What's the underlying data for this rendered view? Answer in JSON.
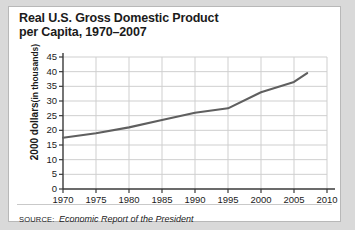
{
  "figure": {
    "title_lines": [
      "Real U.S. Gross Domestic Product",
      "per Capita, 1970–2007"
    ],
    "source_label": "SOURCE:",
    "source_text": "Economic Report of the President",
    "colors": {
      "page_background": "#d9d9d9",
      "card_background": "#ffffff",
      "card_border": "#b8b8b8",
      "text": "#1b1b1b",
      "axis": "#3a3a3a",
      "gridline": "#cfcfcf",
      "series_line": "#5f5f5f",
      "rule": "#c9c9c9"
    }
  },
  "chart_data": {
    "type": "line",
    "title": "Real U.S. Gross Domestic Product per Capita, 1970–2007",
    "xlabel": "",
    "ylabel": "2000 dollars (in thousands)",
    "ylabel_strong": "2000 dollars",
    "ylabel_light": "(in thousands)",
    "xlim": [
      1970,
      2010
    ],
    "ylim": [
      0,
      45
    ],
    "xticks": [
      1970,
      1975,
      1980,
      1985,
      1990,
      1995,
      2000,
      2005,
      2010
    ],
    "xtick_labels": [
      "1970",
      "1975",
      "1980",
      "1985",
      "1990",
      "1995",
      "2000",
      "2005",
      "2010"
    ],
    "yticks": [
      0,
      5,
      10,
      15,
      20,
      25,
      30,
      35,
      40,
      45
    ],
    "ytick_labels": [
      "0",
      "5",
      "10",
      "15",
      "20",
      "25",
      "30",
      "35",
      "40",
      "45"
    ],
    "grid": {
      "horizontal": true,
      "vertical": true
    },
    "legend": {
      "visible": false,
      "position": "none"
    },
    "series": [
      {
        "name": "Real GDP per capita",
        "x": [
          1970,
          1975,
          1980,
          1985,
          1990,
          1995,
          2000,
          2005,
          2007
        ],
        "values": [
          17.5,
          19.0,
          21.0,
          23.5,
          26.0,
          27.5,
          33.0,
          36.5,
          39.5
        ]
      }
    ]
  }
}
